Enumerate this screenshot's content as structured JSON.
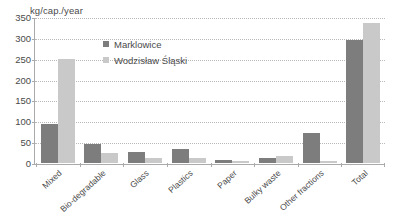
{
  "chart_data": {
    "type": "bar",
    "title": "",
    "subtitle": "",
    "xlabel": "",
    "ylabel": "kg/cap./year",
    "ylim": [
      0,
      350
    ],
    "ytick_step": 50,
    "yticks": [
      350,
      300,
      250,
      200,
      150,
      100,
      50,
      0
    ],
    "grid": true,
    "legend_position": "inside-top-center",
    "categories": [
      "Mixed",
      "Bio-degradable",
      "Glass",
      "Plastics",
      "Paper",
      "Bulky waste",
      "Other fractions",
      "Total"
    ],
    "series": [
      {
        "name": "Marklowice",
        "color": "#7d7d7d",
        "values": [
          93,
          46,
          27,
          33,
          7,
          11,
          71,
          295
        ]
      },
      {
        "name": "Wodzisław Śląski",
        "color": "#c9c9c9",
        "values": [
          250,
          25,
          11,
          13,
          5,
          17,
          4,
          335
        ]
      }
    ]
  },
  "colors": {
    "series_a": "#7d7d7d",
    "series_b": "#c9c9c9",
    "axis": "#aaaaaa",
    "grid": "#b9b9b9",
    "text": "#4a4a4a",
    "background": "#ffffff"
  }
}
